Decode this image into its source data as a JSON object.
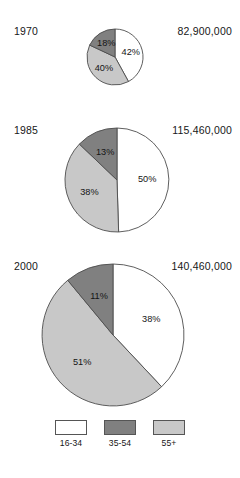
{
  "figure": {
    "background_color": "#ffffff",
    "width": 240,
    "height": 478
  },
  "legend": {
    "position": "bottom-center",
    "items": [
      {
        "label": "16-34",
        "color": "#ffffff",
        "swatch_name": "legend-swatch-16-34"
      },
      {
        "label": "35-54",
        "color": "#808080",
        "swatch_name": "legend-swatch-35-54"
      },
      {
        "label": "55+",
        "color": "#c8c8c8",
        "swatch_name": "legend-swatch-55plus"
      }
    ]
  },
  "charts": [
    {
      "year": "1970",
      "total": "82,900,000",
      "labels": [
        "42%",
        "40%",
        "18%"
      ],
      "center": {
        "x": 115,
        "y": 57
      },
      "radius": 28
    },
    {
      "year": "1985",
      "total": "115,460,000",
      "labels": [
        "50%",
        "38%",
        "13%"
      ],
      "center": {
        "x": 117,
        "y": 180
      },
      "radius": 52
    },
    {
      "year": "2000",
      "total": "140,460,000",
      "labels": [
        "38%",
        "51%",
        "11%"
      ],
      "center": {
        "x": 113,
        "y": 335
      },
      "radius": 71
    }
  ],
  "chart_data": {
    "type": "pie",
    "title": "",
    "subtitle": "",
    "xlabel": "",
    "ylabel": "",
    "grid": false,
    "legend_position": "bottom-center",
    "categories": [
      "16-34",
      "35-54",
      "55+"
    ],
    "category_colors": [
      "#ffffff",
      "#808080",
      "#c8c8c8"
    ],
    "start_angle_deg": 0,
    "direction": "clockwise",
    "series": [
      {
        "name": "1970",
        "total": 82900000,
        "total_label": "82,900,000",
        "slice_order": [
          "16-34",
          "55+",
          "35-54"
        ],
        "values": [
          42,
          40,
          18
        ],
        "value_labels": [
          "42%",
          "40%",
          "18%"
        ],
        "colors": [
          "#ffffff",
          "#c8c8c8",
          "#808080"
        ]
      },
      {
        "name": "1985",
        "total": 115460000,
        "total_label": "115,460,000",
        "slice_order": [
          "16-34",
          "55+",
          "35-54"
        ],
        "values": [
          50,
          38,
          13
        ],
        "value_labels": [
          "50%",
          "38%",
          "13%"
        ],
        "colors": [
          "#ffffff",
          "#c8c8c8",
          "#808080"
        ]
      },
      {
        "name": "2000",
        "total": 140460000,
        "total_label": "140,460,000",
        "slice_order": [
          "16-34",
          "55+",
          "35-54"
        ],
        "values": [
          38,
          51,
          11
        ],
        "value_labels": [
          "38%",
          "51%",
          "11%"
        ],
        "colors": [
          "#ffffff",
          "#c8c8c8",
          "#808080"
        ]
      }
    ]
  }
}
